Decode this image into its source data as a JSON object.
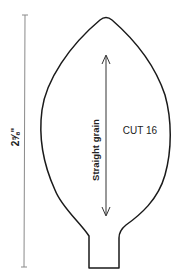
{
  "pattern": {
    "dimension_label": "2⅝\"",
    "grain_label": "Straight grain",
    "cut_label": "CUT 16",
    "colors": {
      "outline": "#1a1a1a",
      "dimension_line": "#8a8a8a",
      "text": "#222222"
    }
  }
}
